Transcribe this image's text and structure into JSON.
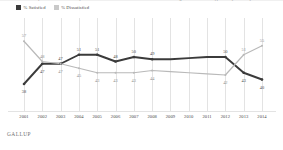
{
  "chart_data": {
    "type": "line",
    "title": "Next, we'd like to know how you feel about the state of the nation in each of the following areas. For each one, please say whether you are very satisfied, somewhat satisfied, somewhat dissatisfied or very dissatisfied.",
    "xlabel": "",
    "ylabel": "",
    "ylim": [
      30,
      62
    ],
    "grid": true,
    "legend_position": "top-left",
    "categories": [
      "2001",
      "2002",
      "2003",
      "2004",
      "2005",
      "2006",
      "2007",
      "2008",
      "2009",
      "2010",
      "2011",
      "2012",
      "2013",
      "2014"
    ],
    "series": [
      {
        "name": "% Satisfied",
        "color": "#3b3b3b",
        "values": [
          38,
          47,
          47,
          51,
          51,
          48,
          50,
          49,
          49,
          49.5,
          50,
          50,
          43,
          40
        ],
        "labels": [
          "38",
          "47",
          "47",
          "51",
          "51",
          "48",
          "50",
          "49",
          "",
          "",
          "",
          "50",
          "43",
          "40"
        ]
      },
      {
        "name": "% Dissatisfied",
        "color": "#b9b9b9",
        "values": [
          57,
          48,
          47,
          45,
          43,
          43,
          43,
          44,
          43.5,
          43,
          42.5,
          42,
          51,
          55
        ],
        "labels": [
          "57",
          "48",
          "47",
          "45",
          "43",
          "43",
          "43",
          "44",
          "",
          "",
          "",
          "42",
          "51",
          "55"
        ]
      }
    ]
  },
  "legend": {
    "items": [
      {
        "label": "% Satisfied",
        "color": "#3b3b3b"
      },
      {
        "label": "% Dissatisfied",
        "color": "#c9c9c9"
      }
    ]
  },
  "source": {
    "brand": "GALLUP"
  }
}
